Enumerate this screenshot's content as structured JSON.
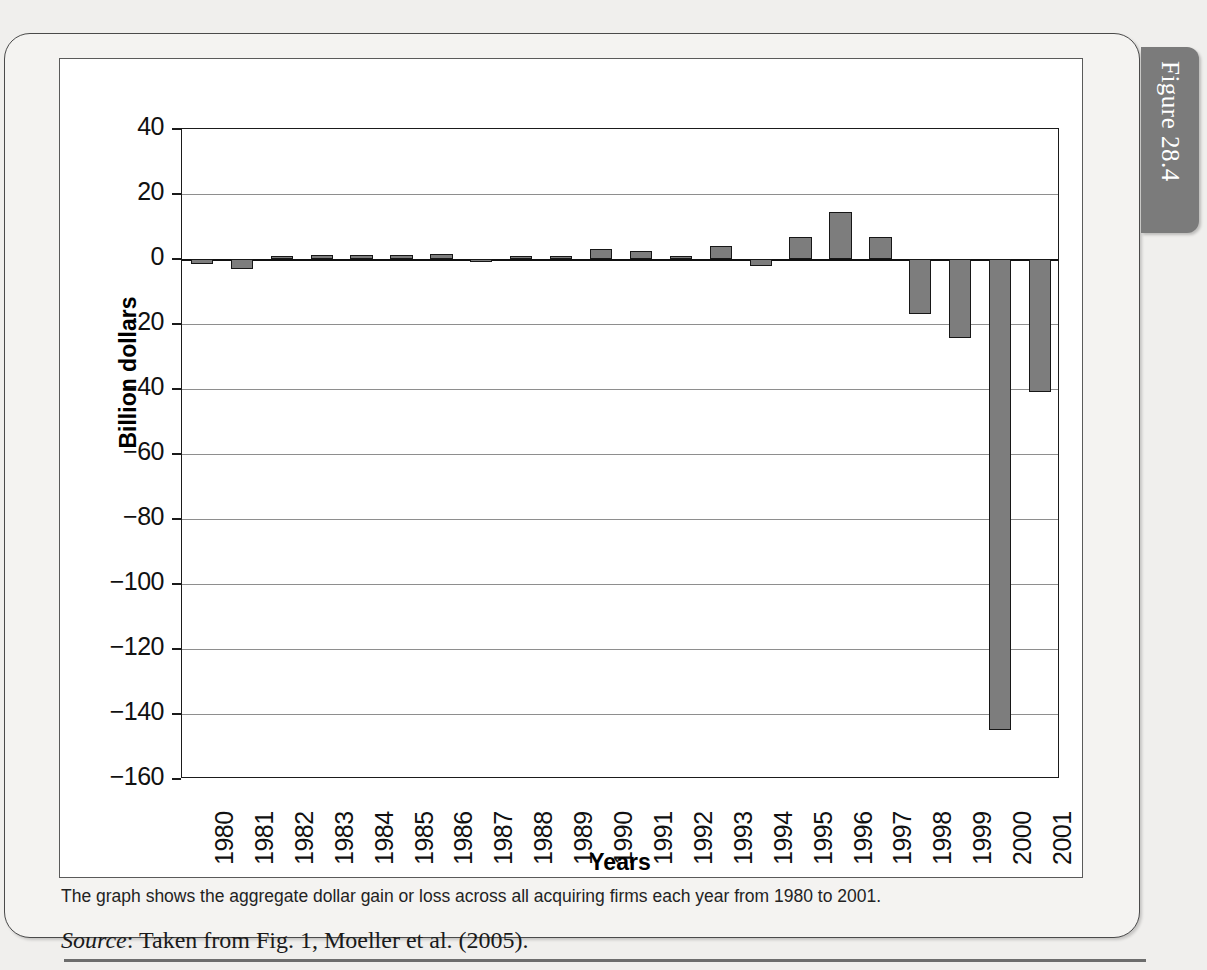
{
  "figure": {
    "tab_label": "Figure 28.4",
    "tab_color": "#7b7b7b"
  },
  "caption": {
    "note": "The graph shows the aggregate dollar gain or loss across all acquiring firms each year from 1980 to 2001.",
    "source_word": "Source",
    "source_rest": ": Taken from Fig. 1, Moeller et al. (2005)."
  },
  "chart_data": {
    "type": "bar",
    "title": "",
    "xlabel": "Years",
    "ylabel": "Billion dollars",
    "ylim": [
      -160,
      40
    ],
    "ytick_step": 20,
    "yticks": [
      40,
      20,
      0,
      -20,
      -40,
      -60,
      -80,
      -100,
      -120,
      -140,
      -160
    ],
    "ytick_labels": [
      "40",
      "20",
      "0",
      "−20",
      "−40",
      "−60",
      "−80",
      "−100",
      "−120",
      "−140",
      "−160"
    ],
    "grid": true,
    "legend": "none",
    "bar_color": "#7d7d7d",
    "bar_edge_color": "#171717",
    "categories": [
      "1980",
      "1981",
      "1982",
      "1983",
      "1984",
      "1985",
      "1986",
      "1987",
      "1988",
      "1989",
      "1990",
      "1991",
      "1992",
      "1993",
      "1994",
      "1995",
      "1996",
      "1997",
      "1998",
      "1999",
      "2000",
      "2001"
    ],
    "values": [
      -1.5,
      -3.2,
      1.0,
      1.2,
      1.2,
      1.2,
      1.6,
      -0.6,
      0.6,
      0.8,
      3.0,
      2.5,
      0.5,
      4.0,
      -2.0,
      6.8,
      14.6,
      6.8,
      -17.0,
      -24.2,
      -145.0,
      -41.0
    ]
  }
}
